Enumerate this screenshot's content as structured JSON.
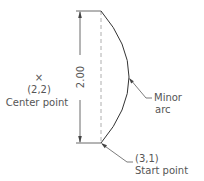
{
  "diagram": {
    "type": "cad-arc-illustration",
    "colors": {
      "line": "#333333",
      "text": "#555555",
      "dashed": "#999999",
      "background": "#ffffff"
    },
    "dimension": {
      "value": "2.00"
    },
    "center_point": {
      "marker": "×",
      "coords": "(2,2)",
      "label": "Center point"
    },
    "arc": {
      "label_line1": "Minor",
      "label_line2": "arc"
    },
    "start_point": {
      "coords": "(3,1)",
      "label": "Start point"
    }
  }
}
